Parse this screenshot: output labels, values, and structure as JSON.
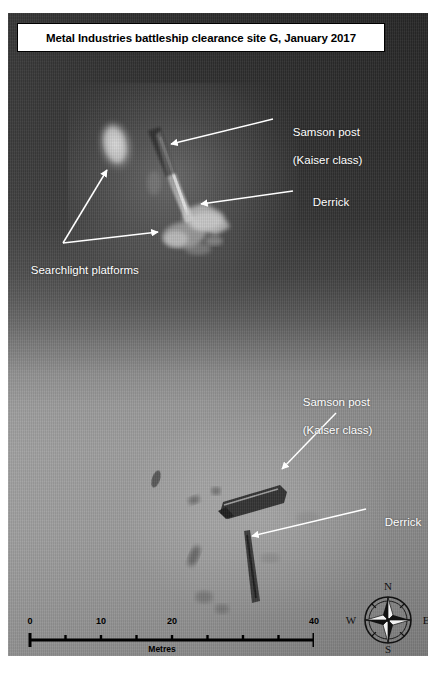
{
  "figure": {
    "title": "Metal Industries battleship clearance site G, January 2017",
    "kind": "side-scan-sonar-survey",
    "colors": {
      "title_box_background": "#ffffff",
      "title_text": "#000000",
      "annotation_text": "#ffffff",
      "water_column_dark": "#2c2c2c",
      "seabed_light": "#9c9c9c",
      "scale_bar": "#000000"
    }
  },
  "annotations": [
    {
      "id": "samson-post-upper",
      "label_line_1": "Samson post",
      "label_line_2": "(Kaiser class)",
      "target": "upper wreck cluster"
    },
    {
      "id": "derrick-upper",
      "label_line_1": "Derrick",
      "label_line_2": "",
      "target": "upper wreck cluster"
    },
    {
      "id": "searchlight-platforms",
      "label_line_1": "Searchlight platforms",
      "label_line_2": "",
      "target": "two bright features, upper cluster"
    },
    {
      "id": "samson-post-lower",
      "label_line_1": "Samson post",
      "label_line_2": "(Kaiser class)",
      "target": "lower wreck cluster"
    },
    {
      "id": "derrick-lower",
      "label_line_1": "Derrick",
      "label_line_2": "",
      "target": "lower wreck cluster"
    }
  ],
  "scale_bar": {
    "unit_label": "Metres",
    "min": 0,
    "max": 40,
    "major_tick_labels": [
      "0",
      "10",
      "20",
      "40"
    ],
    "major_tick_values": [
      0,
      10,
      20,
      40
    ],
    "tick_interval": 5,
    "tick_values": [
      0,
      5,
      10,
      15,
      20,
      25,
      30,
      35,
      40
    ]
  },
  "compass": {
    "north": "N",
    "east": "E",
    "south": "S",
    "west": "W",
    "orientation_note": "north at top"
  }
}
